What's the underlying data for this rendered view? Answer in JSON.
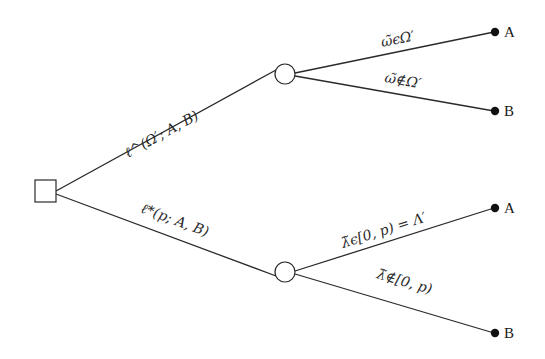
{
  "diagram": {
    "type": "decision-tree",
    "colors": {
      "line": "#2a2a2a",
      "terminal": "#111111",
      "background": "#ffffff"
    },
    "root": {
      "shape": "square",
      "label": ""
    },
    "branches": {
      "upper": {
        "label": "ℓ^(Ω′; A, B)",
        "node_shape": "circle",
        "children": [
          {
            "label": "ω̃ϵΩ′",
            "outcome": "A"
          },
          {
            "label": "ω̃∉Ω′",
            "outcome": "B"
          }
        ]
      },
      "lower": {
        "label": "ℓ*(p; A, B)",
        "node_shape": "circle",
        "children": [
          {
            "label": "λ̃ϵ[0, p) = Λ′",
            "outcome": "A"
          },
          {
            "label": "λ̃∉[0, p)",
            "outcome": "B"
          }
        ]
      }
    }
  }
}
